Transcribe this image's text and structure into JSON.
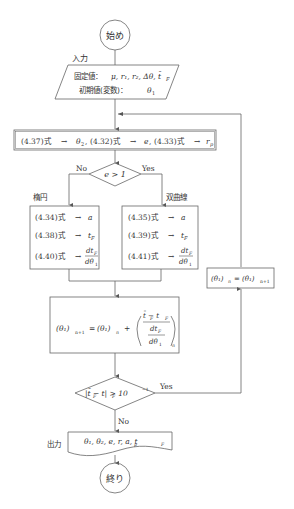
{
  "flowchart": {
    "start": {
      "label": "始め"
    },
    "input": {
      "side_label": "入力",
      "line1_prefix": "固定値：",
      "line1_vars": "μ, r₁, r₂, Δθ, t̄",
      "line1_sub": "F",
      "line2_prefix": "初期値(変数)：",
      "line2_var": "θ",
      "line2_sub": "1"
    },
    "process1": {
      "parts": [
        {
          "eq": "(4.37)式",
          "arrow": "→",
          "var": "θ",
          "sub": "2",
          "sep": ","
        },
        {
          "eq": "(4.32)式",
          "arrow": "→",
          "var": "e",
          "sub": "",
          "sep": ","
        },
        {
          "eq": "(4.33)式",
          "arrow": "→",
          "var": "r",
          "sub": "p",
          "sep": ""
        }
      ]
    },
    "decision1": {
      "condition": "e > 1",
      "no_label": "No",
      "yes_label": "Yes",
      "no_branch_title": "楕円",
      "yes_branch_title": "双曲線"
    },
    "ellipse_box": {
      "rows": [
        {
          "eq": "(4.34)式",
          "arrow": "→",
          "result": "a"
        },
        {
          "eq": "(4.38)式",
          "arrow": "→",
          "result": "t",
          "sub": "F"
        },
        {
          "eq": "(4.40)式",
          "arrow": "→",
          "num": "dt",
          "num_sub": "F",
          "den": "dθ",
          "den_sub": "1"
        }
      ]
    },
    "hyperbola_box": {
      "rows": [
        {
          "eq": "(4.35)式",
          "arrow": "→",
          "result": "a"
        },
        {
          "eq": "(4.39)式",
          "arrow": "→",
          "result": "t",
          "sub": "F"
        },
        {
          "eq": "(4.41)式",
          "arrow": "→",
          "num": "dt",
          "num_sub": "F",
          "den": "dθ",
          "den_sub": "1"
        }
      ]
    },
    "update": {
      "lhs": "(θ₁)",
      "lhs_sub": "n+1",
      "eq": "=",
      "rhs": "(θ₁)",
      "rhs_sub": "n",
      "plus": "+",
      "frac_num": "t̄ − t",
      "frac_num_sub1": "F",
      "frac_num_sub2": "F",
      "frac_den_num": "dt",
      "frac_den_num_sub": "F",
      "frac_den_den": "dθ",
      "frac_den_den_sub": "1",
      "outer_sub": "n"
    },
    "decision2": {
      "condition": "|t̄ − t| > 10",
      "exponent": "−1",
      "sub1": "F",
      "sub2": "F",
      "yes_label": "Yes",
      "no_label": "No"
    },
    "loop_box": {
      "lhs": "(θ₁)",
      "lhs_sub": "n",
      "eq": "=",
      "rhs": "(θ₁)",
      "rhs_sub": "n+1"
    },
    "output": {
      "side_label": "出力",
      "values": "θ₁, θ₂, e, r, a, t",
      "values_sub_r": "p",
      "values_sub_t": "F"
    },
    "end": {
      "label": "終り"
    }
  },
  "colors": {
    "stroke": "#555555",
    "text": "#333333",
    "background": "#ffffff"
  }
}
